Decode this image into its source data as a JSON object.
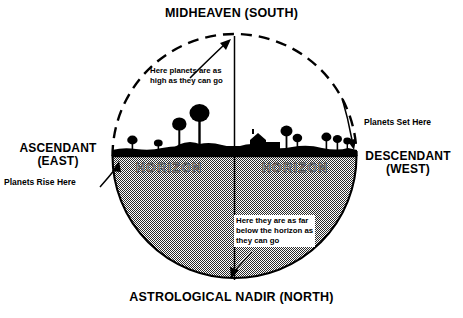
{
  "diagram": {
    "title_top": "MIDHEAVEN (SOUTH)",
    "title_bottom": "ASTROLOGICAL NADIR (NORTH)",
    "left_axis": {
      "name": "ASCENDANT",
      "direction": "(EAST)",
      "callout": "Planets Rise Here"
    },
    "right_axis": {
      "name": "DESCENDANT",
      "direction": "(WEST)",
      "callout": "Planets Set Here"
    },
    "horizon_label_left": "HORIZON",
    "horizon_label_right": "HORIZON",
    "upper_note": {
      "line1": "Here planets are as",
      "line2": "high as they can go"
    },
    "lower_note": {
      "line1": "Here they are as far",
      "line2": "below the horizon as",
      "line3": "they can go"
    },
    "colors": {
      "ink": "#000000",
      "below_horizon_fill": "#808080",
      "background": "#ffffff",
      "horizon_word_stroke": "#3a3a3a"
    }
  }
}
